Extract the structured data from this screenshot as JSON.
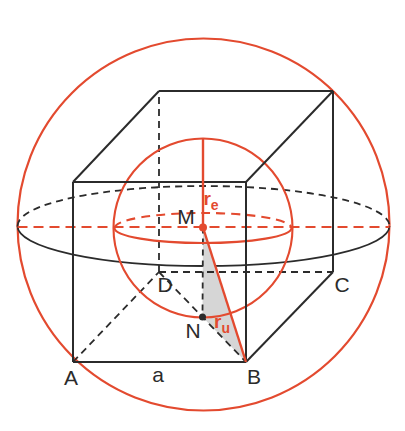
{
  "figure": {
    "canvas": {
      "width": 405,
      "height": 431
    },
    "colors": {
      "red": "#e34a2f",
      "black": "#2b2b2b",
      "shade": "#d6d6d6",
      "background": "#ffffff"
    },
    "shapes": [
      {
        "name": "circumsphere-outline",
        "type": "circle",
        "cx": 203.5,
        "cy": 224.5,
        "r": 186,
        "stroke": "red",
        "sw": 2.2
      },
      {
        "name": "circumsphere-equator-back",
        "type": "path",
        "d": "M 17.5 226 A 186 40 0 0 1 389.5 226",
        "stroke": "black",
        "sw": 1.8,
        "dash": "7 5"
      },
      {
        "name": "circumsphere-equator-front",
        "type": "path",
        "d": "M 17.5 226 A 186 40 0 0 0 389.5 226",
        "stroke": "black",
        "sw": 1.8
      },
      {
        "name": "equator-diameter-line",
        "type": "line",
        "x1": 17.5,
        "y1": 227,
        "x2": 389.5,
        "y2": 227,
        "stroke": "red",
        "sw": 2.2,
        "dash": "10 6"
      },
      {
        "name": "triangle-MNB-shade",
        "type": "polygon",
        "points": "203,227.5 202.5,317 246,362",
        "fill": "shade"
      },
      {
        "name": "cube-edge-AD-hidden",
        "type": "line",
        "x1": 73,
        "y1": 362,
        "x2": 159,
        "y2": 272,
        "stroke": "black",
        "sw": 1.8,
        "dash": "7 5"
      },
      {
        "name": "cube-edge-DC-hidden",
        "type": "line",
        "x1": 159,
        "y1": 272,
        "x2": 333,
        "y2": 272,
        "stroke": "black",
        "sw": 1.8,
        "dash": "7 5"
      },
      {
        "name": "cube-edge-DH-hidden",
        "type": "line",
        "x1": 159,
        "y1": 272,
        "x2": 159,
        "y2": 91,
        "stroke": "black",
        "sw": 1.8,
        "dash": "7 5"
      },
      {
        "name": "base-diagonal-DB",
        "type": "line",
        "x1": 159,
        "y1": 272,
        "x2": 246,
        "y2": 362,
        "stroke": "black",
        "sw": 1.8,
        "dash": "7 5"
      },
      {
        "name": "segment-MN",
        "type": "line",
        "x1": 203,
        "y1": 227.5,
        "x2": 202.5,
        "y2": 317,
        "stroke": "black",
        "sw": 1.8,
        "dash": "6 5"
      },
      {
        "name": "insphere-outline",
        "type": "circle",
        "cx": 203,
        "cy": 228,
        "r": 89.5,
        "stroke": "red",
        "sw": 2.1
      },
      {
        "name": "insphere-equator-back",
        "type": "path",
        "d": "M 114.5 228 A 88.5 15 0 0 1 291.5 228",
        "stroke": "red",
        "sw": 2.1,
        "dash": "9 6"
      },
      {
        "name": "insphere-equator-front",
        "type": "path",
        "d": "M 114.5 228 A 88.5 15 0 0 0 291.5 228",
        "stroke": "red",
        "sw": 2.1
      },
      {
        "name": "cube-edge-AB",
        "type": "line",
        "x1": 73,
        "y1": 362,
        "x2": 246,
        "y2": 362,
        "stroke": "black",
        "sw": 2
      },
      {
        "name": "cube-edge-BF",
        "type": "line",
        "x1": 246,
        "y1": 362,
        "x2": 246,
        "y2": 182,
        "stroke": "black",
        "sw": 2
      },
      {
        "name": "cube-edge-FE",
        "type": "line",
        "x1": 246,
        "y1": 182,
        "x2": 73,
        "y2": 182,
        "stroke": "black",
        "sw": 2
      },
      {
        "name": "cube-edge-EA",
        "type": "line",
        "x1": 73,
        "y1": 182,
        "x2": 73,
        "y2": 362,
        "stroke": "black",
        "sw": 2
      },
      {
        "name": "cube-edge-BC",
        "type": "line",
        "x1": 246,
        "y1": 362,
        "x2": 333,
        "y2": 272,
        "stroke": "black",
        "sw": 2
      },
      {
        "name": "cube-edge-CG",
        "type": "line",
        "x1": 333,
        "y1": 272,
        "x2": 333,
        "y2": 91,
        "stroke": "black",
        "sw": 2
      },
      {
        "name": "cube-edge-GF",
        "type": "line",
        "x1": 333,
        "y1": 91,
        "x2": 246,
        "y2": 182,
        "stroke": "black",
        "sw": 2
      },
      {
        "name": "cube-edge-GH",
        "type": "line",
        "x1": 333,
        "y1": 91,
        "x2": 159,
        "y2": 91,
        "stroke": "black",
        "sw": 2
      },
      {
        "name": "cube-edge-HE",
        "type": "line",
        "x1": 159,
        "y1": 91,
        "x2": 73,
        "y2": 182,
        "stroke": "black",
        "sw": 2
      },
      {
        "name": "radius-re-line",
        "type": "line",
        "x1": 203,
        "y1": 138.5,
        "x2": 203,
        "y2": 227.5,
        "stroke": "red",
        "sw": 2.4
      },
      {
        "name": "radius-ru-line",
        "type": "line",
        "x1": 203,
        "y1": 227.5,
        "x2": 246,
        "y2": 362,
        "stroke": "red",
        "sw": 2.4
      },
      {
        "name": "point-M-dot",
        "type": "circle",
        "cx": 203,
        "cy": 227.5,
        "r": 4,
        "fill": "red"
      },
      {
        "name": "point-N-dot",
        "type": "circle",
        "cx": 202.5,
        "cy": 317,
        "r": 3.5,
        "fill": "black"
      }
    ],
    "labels": [
      {
        "name": "label-vertex-A",
        "text": "A",
        "x": 71,
        "y": 385,
        "size": 21,
        "color": "black"
      },
      {
        "name": "label-edge-a",
        "text": "a",
        "x": 158,
        "y": 382,
        "size": 21,
        "color": "black"
      },
      {
        "name": "label-vertex-B",
        "text": "B",
        "x": 254,
        "y": 384,
        "size": 21,
        "color": "black"
      },
      {
        "name": "label-vertex-C",
        "text": "C",
        "x": 342,
        "y": 292,
        "size": 21,
        "color": "black"
      },
      {
        "name": "label-vertex-D",
        "text": "D",
        "x": 165,
        "y": 292,
        "size": 21,
        "color": "black"
      },
      {
        "name": "label-center-M",
        "text": "M",
        "x": 186,
        "y": 224,
        "size": 21,
        "color": "black"
      },
      {
        "name": "label-point-N",
        "text": "N",
        "x": 193,
        "y": 338,
        "size": 21,
        "color": "black"
      },
      {
        "name": "label-radius-re",
        "text": "r",
        "sub": "e",
        "x": 211,
        "y": 205,
        "size": 19,
        "color": "red",
        "bold": true
      },
      {
        "name": "label-radius-ru",
        "text": "r",
        "sub": "u",
        "x": 222,
        "y": 328,
        "size": 19,
        "color": "red",
        "bold": true
      }
    ]
  }
}
